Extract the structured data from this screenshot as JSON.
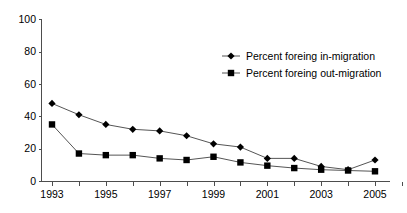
{
  "chart_data": {
    "type": "line",
    "title": "",
    "xlabel": "",
    "ylabel": "",
    "x": [
      1993,
      1994,
      1995,
      1996,
      1997,
      1998,
      1999,
      2000,
      2001,
      2002,
      2003,
      2004,
      2005
    ],
    "xtick_labels": [
      "1993",
      "",
      "1995",
      "",
      "1997",
      "",
      "1999",
      "",
      "2001",
      "",
      "2003",
      "",
      "2005"
    ],
    "xlim": [
      1993,
      2005
    ],
    "ylim": [
      0,
      100
    ],
    "ytick_labels": [
      "0",
      "20",
      "40",
      "60",
      "80",
      "100"
    ],
    "yticks": [
      0,
      20,
      40,
      60,
      80,
      100
    ],
    "grid": false,
    "legend_position": "upper-right-inside",
    "series": [
      {
        "name": "Percent foreing in-migration",
        "marker": "diamond",
        "color": "#000000",
        "values": [
          48,
          41,
          35,
          32,
          31,
          28,
          23,
          21,
          14,
          14,
          9,
          7,
          13
        ]
      },
      {
        "name": "Percent foreing out-migration",
        "marker": "square",
        "color": "#000000",
        "values": [
          35,
          17,
          16,
          16,
          14,
          13,
          15,
          11.5,
          9.5,
          8,
          7,
          6.5,
          6
        ]
      }
    ]
  },
  "axes": {
    "y_axis_name": "percent-axis",
    "x_axis_name": "year-axis"
  },
  "legend": {
    "entries": [
      {
        "label": "Percent foreing in-migration",
        "marker": "diamond"
      },
      {
        "label": "Percent foreing out-migration",
        "marker": "square"
      }
    ]
  }
}
